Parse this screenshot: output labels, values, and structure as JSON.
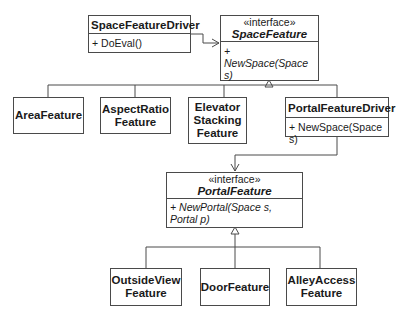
{
  "diagram": {
    "type": "UML class diagram",
    "space_feature_driver": {
      "name": "SpaceFeatureDriver",
      "method": "+ DoEval()"
    },
    "space_feature": {
      "stereotype": "«interface»",
      "name": "SpaceFeature",
      "method": "+ NewSpace(Space s)"
    },
    "area_feature": {
      "name": "AreaFeature"
    },
    "aspect_ratio_feature": {
      "name": "AspectRatio\nFeature"
    },
    "elevator_stacking_feature": {
      "name": "Elevator\nStacking\nFeature"
    },
    "portal_feature_driver": {
      "name": "PortalFeatureDriver",
      "method": "+ NewSpace(Space s)"
    },
    "portal_feature": {
      "stereotype": "«interface»",
      "name": "PortalFeature",
      "method": "+ NewPortal(Space s, Portal p)"
    },
    "outside_view_feature": {
      "name": "OutsideView\nFeature"
    },
    "door_feature": {
      "name": "DoorFeature"
    },
    "alley_access_feature": {
      "name": "AlleyAccess\nFeature"
    },
    "relationships": [
      {
        "from": "SpaceFeatureDriver",
        "to": "SpaceFeature",
        "kind": "dependency"
      },
      {
        "from": "AreaFeature",
        "to": "SpaceFeature",
        "kind": "realization"
      },
      {
        "from": "AspectRatioFeature",
        "to": "SpaceFeature",
        "kind": "realization"
      },
      {
        "from": "ElevatorStackingFeature",
        "to": "SpaceFeature",
        "kind": "realization"
      },
      {
        "from": "PortalFeatureDriver",
        "to": "SpaceFeature",
        "kind": "realization"
      },
      {
        "from": "PortalFeatureDriver",
        "to": "PortalFeature",
        "kind": "dependency"
      },
      {
        "from": "OutsideViewFeature",
        "to": "PortalFeature",
        "kind": "realization"
      },
      {
        "from": "DoorFeature",
        "to": "PortalFeature",
        "kind": "realization"
      },
      {
        "from": "AlleyAccessFeature",
        "to": "PortalFeature",
        "kind": "realization"
      }
    ]
  }
}
